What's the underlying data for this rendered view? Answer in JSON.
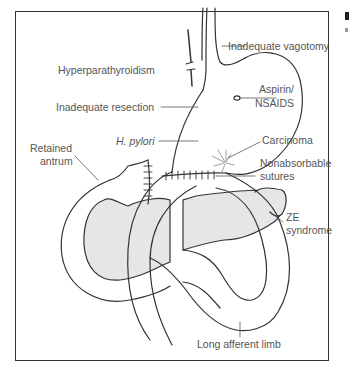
{
  "figure": {
    "type": "anatomical-diagram",
    "colors": {
      "stroke": "#333333",
      "pancreas_fill": "#e6e6e6",
      "label_text": "#555555",
      "frame": "#333333"
    }
  },
  "labels": {
    "hyperparathyroidism": "Hyperparathyroidism",
    "inadequate_vagotomy": "Inadequate vagotomy",
    "inadequate_resection": "Inadequate resection",
    "aspirin_line1": "Aspirin/",
    "aspirin_line2": "NSAIDS",
    "h_pylori": "H. pylori",
    "carcinoma": "Carcinoma",
    "retained_line1": "Retained",
    "retained_line2": "antrum",
    "nonabsorbable_line1": "Nonabsorbable",
    "nonabsorbable_line2": "sutures",
    "ze_line1": "ZE",
    "ze_line2": "syndrome",
    "long_afferent_limb": "Long afferent limb"
  }
}
